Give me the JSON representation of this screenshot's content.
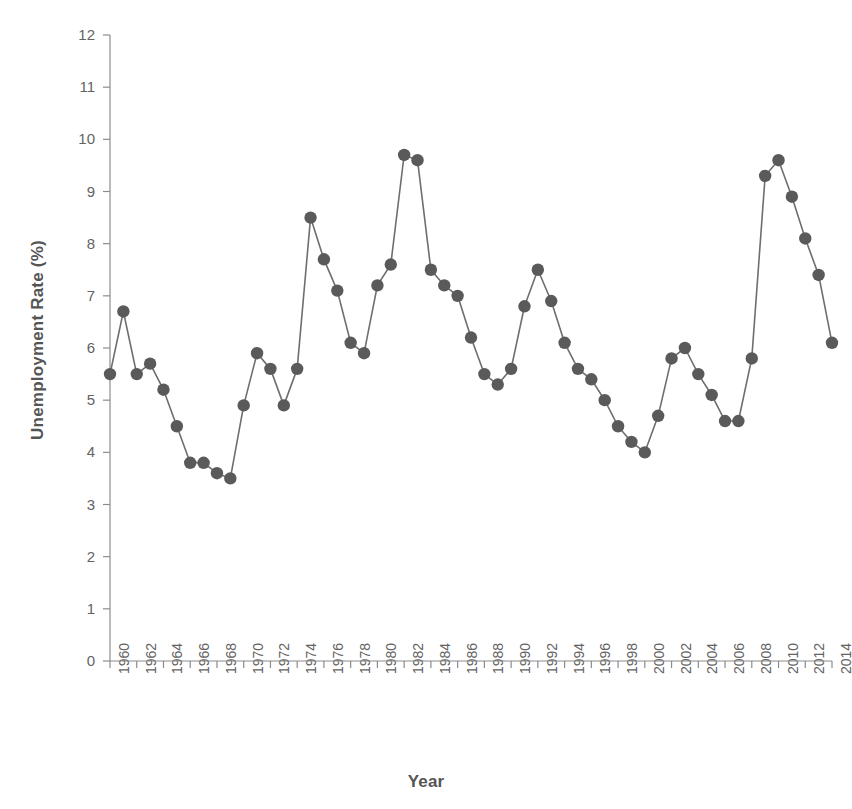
{
  "chart_data": {
    "type": "line",
    "title": "",
    "xlabel": "Year",
    "ylabel": "Unemployment Rate (%)",
    "xlim": [
      1959.5,
      2014.5
    ],
    "ylim": [
      0,
      12
    ],
    "grid": false,
    "legend": "none",
    "marker": "circle",
    "marker_color": "#5a5a5a",
    "line_color": "#6e6e6e",
    "background_color": "#ffffff",
    "axis_color": "#8c8c8c",
    "y_ticks": [
      0,
      1,
      2,
      3,
      4,
      5,
      6,
      7,
      8,
      9,
      10,
      11,
      12
    ],
    "y_tick_labels": [
      "0",
      "1",
      "2",
      "3",
      "4",
      "5",
      "6",
      "7",
      "8",
      "9",
      "10",
      "11",
      "12"
    ],
    "x_tick_labels": [
      "1960",
      "1962",
      "1964",
      "1966",
      "1968",
      "1970",
      "1972",
      "1974",
      "1976",
      "1978",
      "1980",
      "1982",
      "1984",
      "1986",
      "1988",
      "1990",
      "1992",
      "1994",
      "1996",
      "1998",
      "2000",
      "2002",
      "2004",
      "2006",
      "2008",
      "2010",
      "2012",
      "2014"
    ],
    "x_tick_values": [
      1960,
      1962,
      1964,
      1966,
      1968,
      1970,
      1972,
      1974,
      1976,
      1978,
      1980,
      1982,
      1984,
      1986,
      1988,
      1990,
      1992,
      1994,
      1996,
      1998,
      2000,
      2002,
      2004,
      2006,
      2008,
      2010,
      2012,
      2014
    ],
    "x": [
      1960,
      1961,
      1962,
      1963,
      1964,
      1965,
      1966,
      1967,
      1968,
      1969,
      1970,
      1971,
      1972,
      1973,
      1974,
      1975,
      1976,
      1977,
      1978,
      1979,
      1980,
      1981,
      1982,
      1983,
      1984,
      1985,
      1986,
      1987,
      1988,
      1989,
      1990,
      1991,
      1992,
      1993,
      1994,
      1995,
      1996,
      1997,
      1998,
      1999,
      2000,
      2001,
      2002,
      2003,
      2004,
      2005,
      2006,
      2007,
      2008,
      2009,
      2010,
      2011,
      2012,
      2013,
      2014
    ],
    "values": [
      5.5,
      6.7,
      5.5,
      5.7,
      5.2,
      4.5,
      3.8,
      3.8,
      3.6,
      3.5,
      4.9,
      5.9,
      5.6,
      4.9,
      5.6,
      8.5,
      7.7,
      7.1,
      6.1,
      5.9,
      7.2,
      7.6,
      9.7,
      9.6,
      7.5,
      7.2,
      7.0,
      6.2,
      5.5,
      5.3,
      5.6,
      6.8,
      7.5,
      6.9,
      6.1,
      5.6,
      5.4,
      5.0,
      4.5,
      4.2,
      4.0,
      4.7,
      5.8,
      6.0,
      5.5,
      5.1,
      4.6,
      4.6,
      5.8,
      9.3,
      9.6,
      8.9,
      8.1,
      7.4,
      6.1
    ],
    "series_name": "Unemployment Rate"
  },
  "labels": {
    "y_axis_title": "Unemployment Rate (%)",
    "x_axis_title": "Year"
  }
}
